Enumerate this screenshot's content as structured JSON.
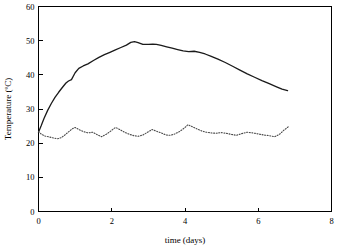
{
  "chart_data": {
    "type": "line",
    "title": "",
    "xlabel": "time (days)",
    "ylabel": "Temperature (ºC)",
    "xlim": [
      0,
      8
    ],
    "ylim": [
      0,
      60
    ],
    "xticks": [
      0,
      2,
      4,
      6,
      8
    ],
    "yticks": [
      0,
      10,
      20,
      30,
      40,
      50,
      60
    ],
    "xtick_labels": [
      "0",
      "2",
      "4",
      "6",
      "8"
    ],
    "ytick_labels": [
      "0",
      "10",
      "20",
      "30",
      "40",
      "50",
      "60"
    ],
    "grid": false,
    "legend": "none",
    "colors": {
      "solid_series": "#1a1a1a",
      "dotted_series": "#4a4a4a",
      "axis": "#000000",
      "background": "#ffffff"
    },
    "series": [
      {
        "name": "compost temperature",
        "style": "solid",
        "x": [
          0.0,
          0.07,
          0.15,
          0.25,
          0.35,
          0.45,
          0.55,
          0.65,
          0.75,
          0.82,
          0.9,
          1.0,
          1.1,
          1.22,
          1.35,
          1.5,
          1.65,
          1.8,
          1.95,
          2.1,
          2.25,
          2.4,
          2.52,
          2.62,
          2.72,
          2.85,
          3.0,
          3.12,
          3.22,
          3.35,
          3.5,
          3.65,
          3.8,
          3.95,
          4.1,
          4.25,
          4.4,
          4.55,
          4.7,
          4.9,
          5.1,
          5.3,
          5.5,
          5.7,
          5.9,
          6.1,
          6.3,
          6.5,
          6.65,
          6.8
        ],
        "y": [
          23.2,
          25.0,
          27.2,
          29.6,
          31.6,
          33.4,
          34.9,
          36.3,
          37.6,
          38.2,
          38.6,
          40.6,
          41.9,
          42.6,
          43.2,
          44.2,
          45.1,
          45.9,
          46.6,
          47.3,
          48.0,
          48.7,
          49.5,
          49.7,
          49.4,
          48.9,
          48.9,
          49.0,
          48.9,
          48.6,
          48.2,
          47.8,
          47.4,
          47.0,
          46.8,
          46.9,
          46.6,
          46.1,
          45.5,
          44.6,
          43.6,
          42.5,
          41.4,
          40.3,
          39.3,
          38.3,
          37.4,
          36.5,
          35.8,
          35.4
        ]
      },
      {
        "name": "ambient temperature",
        "style": "dotted",
        "x": [
          0.0,
          0.08,
          0.18,
          0.3,
          0.42,
          0.52,
          0.62,
          0.72,
          0.82,
          0.92,
          1.0,
          1.1,
          1.22,
          1.35,
          1.48,
          1.6,
          1.72,
          1.85,
          1.98,
          2.1,
          2.22,
          2.35,
          2.48,
          2.6,
          2.72,
          2.85,
          2.98,
          3.1,
          3.22,
          3.35,
          3.48,
          3.6,
          3.72,
          3.85,
          3.98,
          4.08,
          4.2,
          4.32,
          4.45,
          4.58,
          4.72,
          4.85,
          4.98,
          5.12,
          5.25,
          5.4,
          5.55,
          5.7,
          5.85,
          6.0,
          6.15,
          6.3,
          6.45,
          6.58,
          6.7,
          6.82
        ],
        "y": [
          23.4,
          22.6,
          22.1,
          21.8,
          21.5,
          21.3,
          21.6,
          22.4,
          23.3,
          24.2,
          24.6,
          24.0,
          23.4,
          23.0,
          23.2,
          22.5,
          21.9,
          22.6,
          23.6,
          24.6,
          24.0,
          23.2,
          22.6,
          22.2,
          22.0,
          22.4,
          23.2,
          24.0,
          23.5,
          23.0,
          22.4,
          22.3,
          22.7,
          23.4,
          24.4,
          25.4,
          24.8,
          24.2,
          23.6,
          23.2,
          23.0,
          22.9,
          23.1,
          22.9,
          22.6,
          22.3,
          22.8,
          23.2,
          23.0,
          22.7,
          22.4,
          22.2,
          21.9,
          22.6,
          23.8,
          24.8
        ]
      }
    ]
  }
}
